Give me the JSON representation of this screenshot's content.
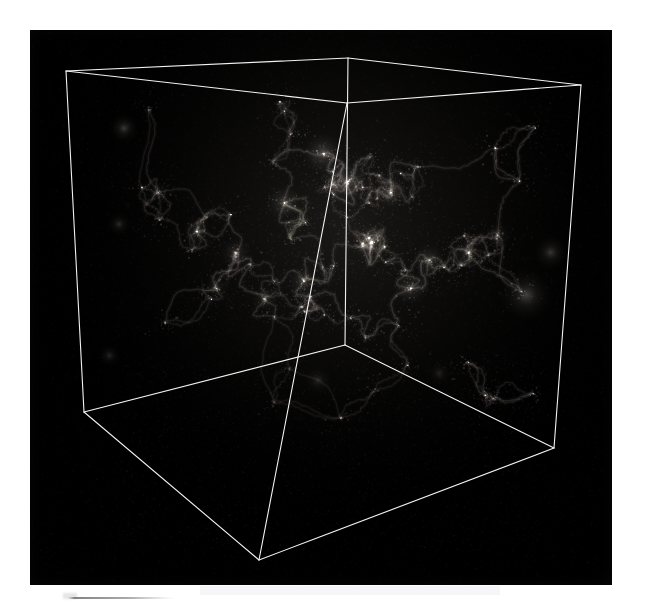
{
  "page": {
    "background_color": "#ffffff",
    "width": 649,
    "height": 606
  },
  "figure": {
    "name": "cosmological-simulation-box",
    "panel": {
      "background_color": "#000000",
      "left": 30,
      "top": 30,
      "width": 582,
      "height": 555
    },
    "render_type": "volume-rendering",
    "content_description": "dark-matter cosmic web filaments inside a cubic simulation volume",
    "wireframe": {
      "stroke_color": "#f2f2f2",
      "stroke_width": 1.1,
      "vertices": {
        "top_back_left": [
          36,
          41
        ],
        "top_back_right": [
          318,
          28
        ],
        "top_front_right": [
          551,
          55
        ],
        "top_front_left": [
          317,
          73
        ],
        "bottom_front_left": [
          54,
          382
        ],
        "bottom_back_center": [
          315,
          315
        ],
        "bottom_front_right": [
          524,
          418
        ],
        "bottom_apex": [
          229,
          530
        ]
      }
    },
    "structure_color_low": "#141414",
    "structure_color_mid": "#6e6a66",
    "structure_color_high": "#d8d4ce"
  },
  "caption_rule": {
    "visible": true,
    "color": "#8c8c8c"
  },
  "chart_data": {
    "type": "scatter",
    "title": "",
    "xlabel": "",
    "ylabel": "",
    "projection": "3d-perspective-cube",
    "grid": false,
    "legend": "none",
    "density_peaks": [
      {
        "x": 0.48,
        "y": 0.22,
        "intensity": 0.92
      },
      {
        "x": 0.53,
        "y": 0.3,
        "intensity": 0.88
      },
      {
        "x": 0.4,
        "y": 0.36,
        "intensity": 0.74
      },
      {
        "x": 0.62,
        "y": 0.33,
        "intensity": 0.7
      },
      {
        "x": 0.58,
        "y": 0.47,
        "intensity": 0.8
      },
      {
        "x": 0.3,
        "y": 0.5,
        "intensity": 0.62
      },
      {
        "x": 0.22,
        "y": 0.44,
        "intensity": 0.55
      },
      {
        "x": 0.7,
        "y": 0.52,
        "intensity": 0.66
      },
      {
        "x": 0.78,
        "y": 0.5,
        "intensity": 0.58
      },
      {
        "x": 0.66,
        "y": 0.6,
        "intensity": 0.72
      },
      {
        "x": 0.44,
        "y": 0.58,
        "intensity": 0.64
      },
      {
        "x": 0.36,
        "y": 0.63,
        "intensity": 0.52
      },
      {
        "x": 0.84,
        "y": 0.45,
        "intensity": 0.48
      },
      {
        "x": 0.14,
        "y": 0.33,
        "intensity": 0.4
      },
      {
        "x": 0.26,
        "y": 0.6,
        "intensity": 0.45
      }
    ],
    "void_regions": [
      {
        "x": 0.2,
        "y": 0.25,
        "radius": 0.1
      },
      {
        "x": 0.74,
        "y": 0.22,
        "radius": 0.09
      },
      {
        "x": 0.3,
        "y": 0.72,
        "radius": 0.08
      },
      {
        "x": 0.84,
        "y": 0.7,
        "radius": 0.1
      }
    ]
  }
}
